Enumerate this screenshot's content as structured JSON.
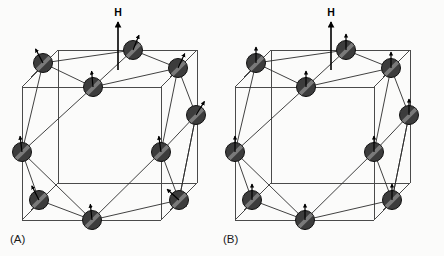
{
  "figure": {
    "background_color": "#fbfbfa",
    "width": 444,
    "height": 256,
    "caption_a": "(A)",
    "caption_b": "(B)"
  },
  "style": {
    "sphere_fill": "#3c3c3c",
    "sphere_stroke": "#111111",
    "sphere_highlight": "#8f8f8f",
    "sphere_radius": 9.5,
    "cube_line_color": "#4a4a4a",
    "bond_line_color": "#2b2b2b",
    "arrow_color": "#000000",
    "field_arrow_color": "#000000",
    "caption_color": "#1a1a1a"
  },
  "panels": [
    {
      "id": "A",
      "caption": "(A)",
      "caption_x": 10,
      "caption_y": 243,
      "origin_x": 0,
      "field": {
        "label": "H",
        "label_x": 118,
        "label_y": 16,
        "arrow_x": 118,
        "arrow_y_top": 22,
        "arrow_y_bottom": 70
      },
      "spin_mode": "canted",
      "cube": {
        "front": {
          "x": 22,
          "y": 87,
          "w": 139,
          "h": 133
        },
        "depth_dx": 36,
        "depth_dy": -37
      },
      "atoms": [
        {
          "name": "atom-top-left",
          "x": 43,
          "y": 63,
          "spin_angle": -28
        },
        {
          "name": "atom-top-center",
          "x": 133,
          "y": 50,
          "spin_angle": 22
        },
        {
          "name": "atom-top-right",
          "x": 178,
          "y": 68,
          "spin_angle": 25
        },
        {
          "name": "atom-upper-mid",
          "x": 93,
          "y": 87,
          "spin_angle": -5
        },
        {
          "name": "atom-left-mid",
          "x": 22,
          "y": 152,
          "spin_angle": -7
        },
        {
          "name": "atom-right-mid",
          "x": 161,
          "y": 152,
          "spin_angle": -8
        },
        {
          "name": "atom-far-right",
          "x": 196,
          "y": 115,
          "spin_angle": 32
        },
        {
          "name": "atom-lower-left",
          "x": 39,
          "y": 200,
          "spin_angle": -27
        },
        {
          "name": "atom-bottom-center",
          "x": 92,
          "y": 220,
          "spin_angle": -6
        },
        {
          "name": "atom-lower-right",
          "x": 179,
          "y": 200,
          "spin_angle": -48
        }
      ],
      "bonds": [
        [
          0,
          3
        ],
        [
          0,
          4
        ],
        [
          3,
          1
        ],
        [
          3,
          2
        ],
        [
          1,
          2
        ],
        [
          2,
          6
        ],
        [
          2,
          5
        ],
        [
          6,
          5
        ],
        [
          6,
          9
        ],
        [
          4,
          7
        ],
        [
          4,
          8
        ],
        [
          4,
          3
        ],
        [
          7,
          8
        ],
        [
          8,
          9
        ],
        [
          8,
          5
        ],
        [
          5,
          9
        ],
        [
          0,
          1
        ],
        [
          9,
          6
        ]
      ]
    },
    {
      "id": "B",
      "caption": "(B)",
      "caption_x": 223,
      "caption_y": 243,
      "origin_x": 213,
      "field": {
        "label": "H",
        "label_x": 331,
        "label_y": 16,
        "arrow_x": 331,
        "arrow_y_top": 22,
        "arrow_y_bottom": 70
      },
      "spin_mode": "aligned",
      "cube": {
        "front": {
          "x": 235,
          "y": 87,
          "w": 139,
          "h": 133
        },
        "depth_dx": 36,
        "depth_dy": -37
      },
      "atoms": [
        {
          "name": "atom-top-left",
          "x": 256,
          "y": 63,
          "spin_angle": 0
        },
        {
          "name": "atom-top-center",
          "x": 346,
          "y": 50,
          "spin_angle": 0
        },
        {
          "name": "atom-top-right",
          "x": 391,
          "y": 68,
          "spin_angle": 0
        },
        {
          "name": "atom-upper-mid",
          "x": 306,
          "y": 87,
          "spin_angle": 0
        },
        {
          "name": "atom-left-mid",
          "x": 235,
          "y": 152,
          "spin_angle": 0
        },
        {
          "name": "atom-right-mid",
          "x": 374,
          "y": 152,
          "spin_angle": 0
        },
        {
          "name": "atom-far-right",
          "x": 409,
          "y": 115,
          "spin_angle": 0
        },
        {
          "name": "atom-lower-left",
          "x": 252,
          "y": 200,
          "spin_angle": 0
        },
        {
          "name": "atom-bottom-center",
          "x": 305,
          "y": 220,
          "spin_angle": 0
        },
        {
          "name": "atom-lower-right",
          "x": 392,
          "y": 200,
          "spin_angle": 0
        }
      ],
      "bonds": [
        [
          0,
          3
        ],
        [
          0,
          4
        ],
        [
          3,
          1
        ],
        [
          3,
          2
        ],
        [
          1,
          2
        ],
        [
          2,
          6
        ],
        [
          2,
          5
        ],
        [
          6,
          5
        ],
        [
          6,
          9
        ],
        [
          4,
          7
        ],
        [
          4,
          8
        ],
        [
          4,
          3
        ],
        [
          7,
          8
        ],
        [
          8,
          9
        ],
        [
          8,
          5
        ],
        [
          5,
          9
        ],
        [
          0,
          1
        ],
        [
          9,
          6
        ]
      ]
    }
  ]
}
